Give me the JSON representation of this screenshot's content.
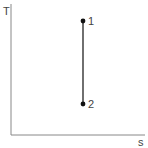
{
  "diagram": {
    "type": "T-s diagram",
    "axes": {
      "y_label": "T",
      "x_label": "s"
    },
    "points": [
      {
        "label": "1",
        "x": 83,
        "y": 21
      },
      {
        "label": "2",
        "x": 83,
        "y": 104
      }
    ],
    "process": {
      "from": "1",
      "to": "2",
      "kind": "isentropic (vertical line)"
    },
    "colors": {
      "axis": "#888888",
      "line": "#333333",
      "point": "#111111"
    }
  }
}
